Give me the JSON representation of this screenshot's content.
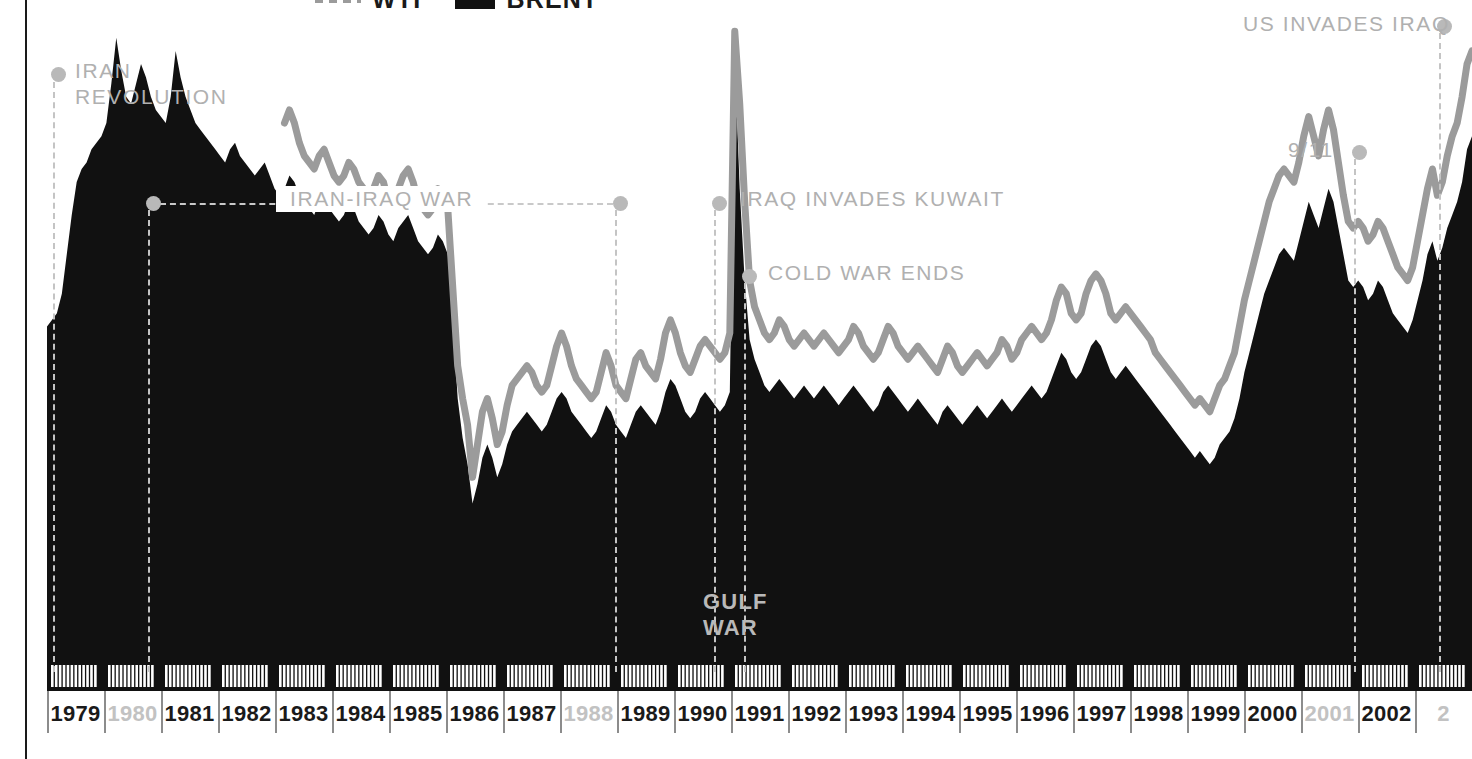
{
  "legend": {
    "items": [
      {
        "label": "WTI",
        "swatch": "dashed-gray-line",
        "color": "#9b9b9b"
      },
      {
        "label": "BRENT",
        "swatch": "solid-black-block",
        "color": "#111111"
      }
    ]
  },
  "annotations": [
    {
      "name": "iran-revolution",
      "label": "IRAN\nREVOLUTION",
      "dot_x": 51,
      "dot_y": 67,
      "text_x": 75,
      "text_y": 58,
      "vline_x": 53,
      "vline_top": 82,
      "vline_bottom": 672
    },
    {
      "name": "iran-iraq-war",
      "label": "IRAN-IRAQ WAR",
      "dot_x": 146,
      "dot_y": 196,
      "dot2_x": 613,
      "dot2_y": 196,
      "text_x": 276,
      "text_y": 186,
      "vline_x": 148,
      "vline_top": 210,
      "vline_bottom": 672,
      "vline2_x": 615,
      "vline2_top": 210,
      "vline2_bottom": 672
    },
    {
      "name": "iraq-invades-kuwait",
      "label": "IRAQ INVADES KUWAIT",
      "dot_x": 712,
      "dot_y": 196,
      "text_x": 740,
      "text_y": 186,
      "vline_x": 714,
      "vline_top": 210,
      "vline_bottom": 672
    },
    {
      "name": "cold-war-ends",
      "label": "COLD WAR ENDS",
      "dot_x": 742,
      "dot_y": 269,
      "text_x": 768,
      "text_y": 260,
      "vline_x": 744,
      "vline_top": 283,
      "vline_bottom": 672
    },
    {
      "name": "gulf-war",
      "label": "GULF\nWAR",
      "text_x": 703,
      "text_y": 589,
      "on_black": true
    },
    {
      "name": "nine-eleven",
      "label": "9/11",
      "dot_x": 1352,
      "dot_y": 145,
      "text_x": 1288,
      "text_y": 137,
      "vline_x": 1354,
      "vline_top": 159,
      "vline_bottom": 672
    },
    {
      "name": "us-invades-iraq",
      "label": "US INVADES IRAQ",
      "dot_x": 1437,
      "dot_y": 19,
      "text_x": 1243,
      "text_y": 11,
      "vline_x": 1439,
      "vline_top": 33,
      "vline_bottom": 672
    }
  ],
  "xaxis": {
    "dim_color": "#c2c2c2",
    "labels": [
      {
        "year": "1979",
        "dim": false
      },
      {
        "year": "1980",
        "dim": true
      },
      {
        "year": "1981",
        "dim": false
      },
      {
        "year": "1982",
        "dim": false
      },
      {
        "year": "1983",
        "dim": false
      },
      {
        "year": "1984",
        "dim": false
      },
      {
        "year": "1985",
        "dim": false
      },
      {
        "year": "1986",
        "dim": false
      },
      {
        "year": "1987",
        "dim": false
      },
      {
        "year": "1988",
        "dim": true
      },
      {
        "year": "1989",
        "dim": false
      },
      {
        "year": "1990",
        "dim": false
      },
      {
        "year": "1991",
        "dim": false
      },
      {
        "year": "1992",
        "dim": false
      },
      {
        "year": "1993",
        "dim": false
      },
      {
        "year": "1994",
        "dim": false
      },
      {
        "year": "1995",
        "dim": false
      },
      {
        "year": "1996",
        "dim": false
      },
      {
        "year": "1997",
        "dim": false
      },
      {
        "year": "1998",
        "dim": false
      },
      {
        "year": "1999",
        "dim": false
      },
      {
        "year": "2000",
        "dim": false
      },
      {
        "year": "2001",
        "dim": true
      },
      {
        "year": "2002",
        "dim": false
      },
      {
        "year": "2",
        "dim": true
      }
    ]
  },
  "chart_data": {
    "type": "area",
    "title": "",
    "xlabel": "",
    "ylabel": "",
    "grid": false,
    "legend_position": "top-center",
    "x_start": "1979",
    "x_end": "2003",
    "x_tick_interval": "month",
    "series": [
      {
        "name": "BRENT",
        "style": "filled-area",
        "color": "#111111",
        "values": [
          51,
          52,
          53,
          56,
          62,
          68,
          73,
          75,
          76,
          78,
          79,
          80,
          82,
          88,
          95,
          90,
          86,
          85,
          88,
          91,
          89,
          86,
          84,
          83,
          82,
          86,
          93,
          89,
          86,
          84,
          82,
          81,
          80,
          79,
          78,
          77,
          76,
          78,
          79,
          77,
          76,
          75,
          74,
          75,
          76,
          74,
          72,
          71,
          72,
          74,
          73,
          71,
          70,
          69,
          68,
          70,
          71,
          69,
          68,
          67,
          68,
          70,
          69,
          67,
          66,
          65,
          66,
          68,
          67,
          65,
          64,
          66,
          67,
          68,
          66,
          64,
          63,
          62,
          63,
          65,
          64,
          62,
          52,
          40,
          34,
          30,
          24,
          27,
          31,
          33,
          31,
          28,
          30,
          33,
          35,
          36,
          37,
          38,
          37,
          36,
          35,
          36,
          38,
          40,
          41,
          40,
          38,
          37,
          36,
          35,
          34,
          35,
          37,
          39,
          38,
          36,
          35,
          34,
          36,
          38,
          39,
          38,
          37,
          36,
          38,
          41,
          43,
          42,
          40,
          38,
          37,
          38,
          40,
          41,
          40,
          39,
          38,
          39,
          41,
          92,
          72,
          58,
          49,
          46,
          44,
          42,
          41,
          42,
          43,
          42,
          41,
          40,
          41,
          42,
          41,
          40,
          41,
          42,
          41,
          40,
          39,
          40,
          41,
          42,
          41,
          40,
          39,
          38,
          39,
          41,
          42,
          41,
          40,
          39,
          38,
          39,
          40,
          39,
          38,
          37,
          36,
          38,
          39,
          38,
          37,
          36,
          37,
          38,
          39,
          38,
          37,
          38,
          39,
          40,
          39,
          38,
          39,
          40,
          41,
          42,
          41,
          40,
          41,
          43,
          45,
          47,
          46,
          44,
          43,
          44,
          46,
          48,
          49,
          48,
          46,
          44,
          43,
          44,
          45,
          44,
          43,
          42,
          41,
          40,
          39,
          38,
          37,
          36,
          35,
          34,
          33,
          32,
          31,
          32,
          31,
          30,
          31,
          33,
          34,
          35,
          37,
          40,
          44,
          47,
          50,
          53,
          56,
          58,
          60,
          62,
          63,
          62,
          61,
          64,
          67,
          70,
          68,
          66,
          69,
          72,
          70,
          66,
          62,
          58,
          57,
          58,
          57,
          55,
          56,
          58,
          57,
          55,
          53,
          52,
          51,
          50,
          52,
          55,
          58,
          62,
          64,
          61,
          63,
          66,
          68,
          70,
          73,
          78,
          80
        ]
      },
      {
        "name": "WTI",
        "style": "line",
        "color": "#9b9b9b",
        "values": [
          null,
          null,
          null,
          null,
          null,
          null,
          null,
          null,
          null,
          null,
          null,
          null,
          null,
          null,
          null,
          null,
          null,
          null,
          null,
          null,
          null,
          null,
          null,
          null,
          null,
          null,
          null,
          null,
          null,
          null,
          null,
          null,
          null,
          null,
          null,
          null,
          null,
          null,
          null,
          null,
          null,
          null,
          null,
          null,
          null,
          null,
          null,
          null,
          82,
          84,
          82,
          79,
          77,
          76,
          75,
          77,
          78,
          76,
          74,
          73,
          74,
          76,
          75,
          73,
          72,
          70,
          72,
          74,
          73,
          70,
          69,
          72,
          74,
          75,
          73,
          70,
          69,
          68,
          69,
          72,
          71,
          69,
          57,
          45,
          40,
          36,
          28,
          33,
          38,
          40,
          37,
          33,
          35,
          39,
          42,
          43,
          44,
          45,
          44,
          42,
          41,
          42,
          45,
          48,
          50,
          48,
          45,
          43,
          42,
          41,
          40,
          41,
          44,
          47,
          45,
          42,
          41,
          40,
          43,
          46,
          47,
          45,
          44,
          43,
          46,
          50,
          52,
          50,
          47,
          45,
          44,
          46,
          48,
          49,
          48,
          47,
          46,
          47,
          50,
          96,
          85,
          70,
          58,
          54,
          52,
          50,
          49,
          50,
          52,
          51,
          49,
          48,
          49,
          50,
          49,
          48,
          49,
          50,
          49,
          48,
          47,
          48,
          49,
          51,
          50,
          48,
          47,
          46,
          47,
          49,
          51,
          50,
          48,
          47,
          46,
          47,
          48,
          47,
          46,
          45,
          44,
          46,
          48,
          47,
          45,
          44,
          45,
          46,
          47,
          46,
          45,
          46,
          47,
          49,
          48,
          46,
          47,
          49,
          50,
          51,
          50,
          49,
          50,
          52,
          55,
          57,
          56,
          53,
          52,
          53,
          56,
          58,
          59,
          58,
          56,
          53,
          52,
          53,
          54,
          53,
          52,
          51,
          50,
          49,
          47,
          46,
          45,
          44,
          43,
          42,
          41,
          40,
          39,
          40,
          39,
          38,
          40,
          42,
          43,
          45,
          47,
          51,
          55,
          58,
          61,
          64,
          67,
          70,
          72,
          74,
          75,
          74,
          73,
          76,
          80,
          83,
          80,
          77,
          81,
          84,
          81,
          76,
          71,
          67,
          66,
          67,
          66,
          64,
          65,
          67,
          66,
          64,
          62,
          60,
          59,
          58,
          60,
          64,
          68,
          72,
          75,
          71,
          73,
          77,
          80,
          82,
          86,
          91,
          93
        ]
      }
    ],
    "note": "Values are pixel-height readings off the plot (higher = higher price). BRENT drawn as solid black filled area; WTI drawn as a thick gray line above it. WTI series begins in 1983."
  }
}
